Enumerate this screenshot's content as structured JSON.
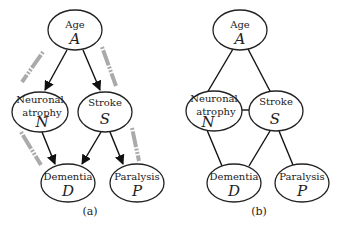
{
  "panels": [
    {
      "id": "a",
      "caption": "(a)",
      "type": "directed",
      "nodes": [
        {
          "id": "A",
          "label": "Age",
          "symbol": "A"
        },
        {
          "id": "N",
          "label_line1": "Neuronal",
          "label_line2": "atrophy",
          "symbol": "N"
        },
        {
          "id": "S",
          "label": "Stroke",
          "symbol": "S"
        },
        {
          "id": "D",
          "label": "Dementia",
          "symbol": "D"
        },
        {
          "id": "P",
          "label": "Paralysis",
          "symbol": "P"
        }
      ],
      "edges": [
        {
          "from": "A",
          "to": "N",
          "arrow": true,
          "highlighted": true
        },
        {
          "from": "A",
          "to": "S",
          "arrow": true,
          "highlighted": true
        },
        {
          "from": "N",
          "to": "D",
          "arrow": true,
          "highlighted": true
        },
        {
          "from": "S",
          "to": "D",
          "arrow": true,
          "highlighted": false
        },
        {
          "from": "S",
          "to": "P",
          "arrow": true,
          "highlighted": true
        }
      ]
    },
    {
      "id": "b",
      "caption": "(b)",
      "type": "undirected",
      "nodes": [
        {
          "id": "A",
          "label": "Age",
          "symbol": "A"
        },
        {
          "id": "N",
          "label_line1": "Neuronal",
          "label_line2": "atrophy",
          "symbol": "N"
        },
        {
          "id": "S",
          "label": "Stroke",
          "symbol": "S"
        },
        {
          "id": "D",
          "label": "Dementia",
          "symbol": "D"
        },
        {
          "id": "P",
          "label": "Paralysis",
          "symbol": "P"
        }
      ],
      "edges": [
        {
          "from": "A",
          "to": "N"
        },
        {
          "from": "A",
          "to": "S"
        },
        {
          "from": "N",
          "to": "S"
        },
        {
          "from": "N",
          "to": "D"
        },
        {
          "from": "S",
          "to": "D"
        },
        {
          "from": "S",
          "to": "P"
        }
      ]
    }
  ]
}
